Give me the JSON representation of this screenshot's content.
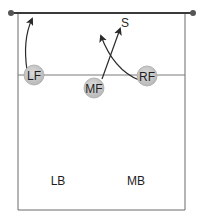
{
  "diagram": {
    "type": "volleyball-court-rotation",
    "colors": {
      "court_line": "#6a6a6a",
      "net": "#3a3a3a",
      "player_fill": "#c8c8c8",
      "player_stroke": "#aaaaaa",
      "arrow": "#2a2a2a",
      "text": "#1e1e1e"
    },
    "net": {
      "label": ""
    },
    "players": [
      {
        "id": "LF",
        "label": "LF",
        "x": 34,
        "y": 75
      },
      {
        "id": "MF",
        "label": "MF",
        "x": 94,
        "y": 88
      },
      {
        "id": "RF",
        "label": "RF",
        "x": 147,
        "y": 76
      }
    ],
    "back_row": [
      {
        "id": "LB",
        "label": "LB",
        "x": 58,
        "y": 185
      },
      {
        "id": "MB",
        "label": "MB",
        "x": 136,
        "y": 185
      }
    ],
    "target": {
      "label": "S",
      "x": 124,
      "y": 26
    },
    "movements": [
      {
        "from": "LF",
        "description": "LF moves up toward the net"
      },
      {
        "from": "MF",
        "to": "S",
        "description": "MF moves diagonally toward S"
      },
      {
        "from": "RF",
        "description": "RF curves up and left toward center"
      }
    ]
  }
}
